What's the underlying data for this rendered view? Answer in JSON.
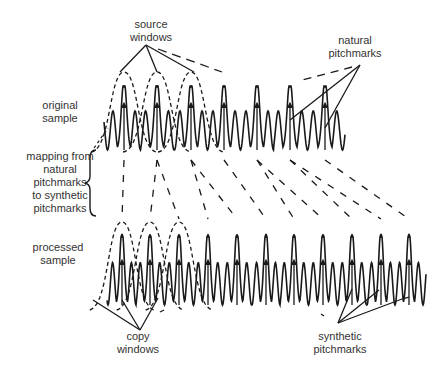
{
  "labels": {
    "source_windows": [
      "source",
      "windows"
    ],
    "natural_pitchmarks": [
      "natural",
      "pitchmarks"
    ],
    "original_sample": [
      "original",
      "sample"
    ],
    "mapping": [
      "mapping from",
      "natural",
      "pitchmarks",
      "to synthetic",
      "pitchmarks"
    ],
    "processed_sample": [
      "processed",
      "sample"
    ],
    "copy_windows": [
      "copy",
      "windows"
    ],
    "synthetic_pitchmarks": [
      "synthetic",
      "pitchmarks"
    ]
  },
  "original": {
    "pitchmarks_x": [
      124,
      157,
      191,
      224,
      257,
      290,
      325
    ],
    "baseline_y": 150,
    "peak_y": 78,
    "arrow_head_y": 105,
    "source_window_count": 3
  },
  "processed": {
    "pitchmarks_x": [
      122,
      150,
      179,
      208,
      237,
      266,
      294,
      323,
      352,
      381,
      409
    ],
    "baseline_y": 305,
    "peak_y": 227,
    "arrow_head_y": 262,
    "copy_window_count": 3
  },
  "mapping": [
    [
      124,
      122
    ],
    [
      157,
      150
    ],
    [
      157,
      179
    ],
    [
      191,
      208
    ],
    [
      191,
      237
    ],
    [
      224,
      266
    ],
    [
      257,
      294
    ],
    [
      257,
      323
    ],
    [
      290,
      352
    ],
    [
      290,
      381
    ],
    [
      325,
      409
    ]
  ],
  "colors": {
    "ink": "#1a1a1a",
    "text": "#333333"
  }
}
